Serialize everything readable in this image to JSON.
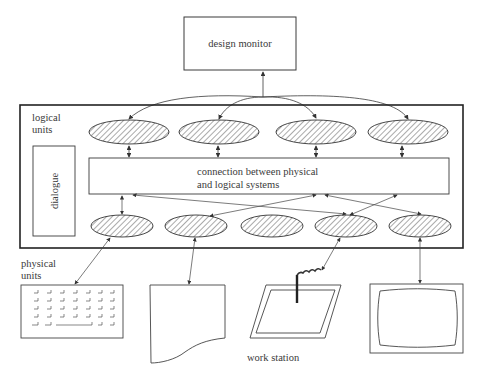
{
  "diagram": {
    "design_monitor": {
      "label": "design monitor"
    },
    "logical_units": {
      "label_line1": "logical",
      "label_line2": "units",
      "count": 4
    },
    "dialogue": {
      "label": "dialogue"
    },
    "connection": {
      "line1": "connection between physical",
      "line2": "and logical systems"
    },
    "physical_layer": {
      "ellipse_count": 5
    },
    "physical_units": {
      "label_line1": "physical",
      "label_line2": "units",
      "devices": [
        "keyboard",
        "printer-paper",
        "graphics-tablet",
        "display-screen"
      ]
    },
    "work_station": {
      "label": "work station"
    }
  },
  "colors": {
    "stroke": "#3a3a3a",
    "hatch": "#555555",
    "text": "#3a3a3a",
    "background": "#ffffff"
  }
}
